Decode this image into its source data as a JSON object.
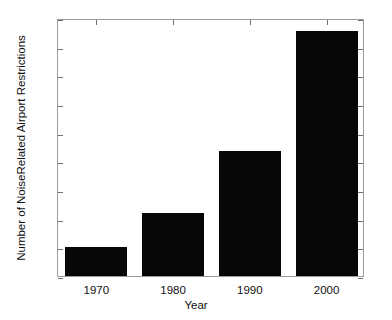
{
  "chart_data": {
    "type": "bar",
    "title": "",
    "subtitle": "",
    "xlabel": "Year",
    "ylabel": "Number of NoiseRelated Airport Restrictions",
    "categories": [
      "1970",
      "1980",
      "1990",
      "2000"
    ],
    "values": [
      100,
      220,
      437,
      855
    ],
    "series": [
      {
        "name": "Noise-related airport restrictions",
        "values": [
          100,
          220,
          437,
          855
        ]
      }
    ],
    "ylim": [
      0,
      900
    ],
    "yticks": [
      0,
      100,
      200,
      300,
      400,
      500,
      600,
      700,
      800,
      900
    ],
    "ytick_labels": [
      "0",
      "100",
      "200",
      "300",
      "400",
      "500",
      "600",
      "700",
      "800",
      "900"
    ],
    "xtick_labels": [
      "1970",
      "1980",
      "1990",
      "2000"
    ],
    "grid": false,
    "legend": "none",
    "bar_color": "#070707",
    "background_color": "#ffffff",
    "axis_color": "#9a9a9a",
    "tick_color": "#6f6f6f",
    "annotations": []
  }
}
